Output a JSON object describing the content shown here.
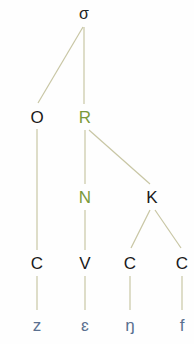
{
  "diagram": {
    "type": "syllable-structure-tree",
    "colors": {
      "line": "#c8c6a4",
      "node": "#1a1a1a",
      "highlight": "#7a9a3a",
      "segment": "#5a7090"
    },
    "root": {
      "label": "σ",
      "x": 84,
      "y": 14
    },
    "onset": {
      "label": "O",
      "x": 37,
      "y": 117
    },
    "rhyme": {
      "label": "R",
      "x": 85,
      "y": 117
    },
    "nucleus": {
      "label": "N",
      "x": 85,
      "y": 197
    },
    "coda": {
      "label": "K",
      "x": 152,
      "y": 197
    },
    "skeleton": [
      {
        "label": "C",
        "x": 37,
        "y": 263
      },
      {
        "label": "V",
        "x": 85,
        "y": 263
      },
      {
        "label": "C",
        "x": 130,
        "y": 263
      },
      {
        "label": "C",
        "x": 182,
        "y": 263
      }
    ],
    "segments": [
      {
        "label": "z",
        "x": 37,
        "y": 325
      },
      {
        "label": "ɛ",
        "x": 85,
        "y": 325
      },
      {
        "label": "ŋ",
        "x": 130,
        "y": 325
      },
      {
        "label": "f",
        "x": 182,
        "y": 325
      }
    ],
    "edges": [
      [
        "root",
        "onset"
      ],
      [
        "root",
        "rhyme"
      ],
      [
        "onset",
        "skeleton.0"
      ],
      [
        "rhyme",
        "nucleus"
      ],
      [
        "rhyme",
        "coda"
      ],
      [
        "nucleus",
        "skeleton.1"
      ],
      [
        "coda",
        "skeleton.2"
      ],
      [
        "coda",
        "skeleton.3"
      ],
      [
        "skeleton.0",
        "segments.0"
      ],
      [
        "skeleton.1",
        "segments.1"
      ],
      [
        "skeleton.2",
        "segments.2"
      ],
      [
        "skeleton.3",
        "segments.3"
      ]
    ]
  }
}
